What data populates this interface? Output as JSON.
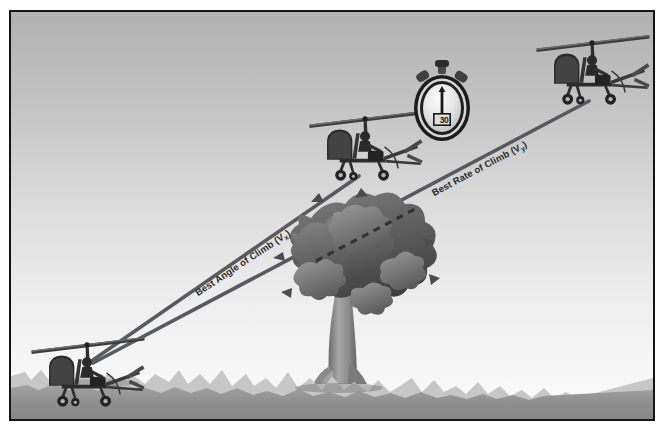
{
  "figure": {
    "border_color": "#141414",
    "background_color": "#ffffff"
  },
  "sky": {
    "name": "sky-gradient",
    "top_color": "#b4b4b4",
    "bottom_color": "#fbfbfb"
  },
  "ground": {
    "name": "ground",
    "grass_tip_color": "#c9c9c9",
    "mid_color": "#9c9c9c",
    "fore_color": "#8b8b8b",
    "horizon_y": 372
  },
  "labels": {
    "vx": {
      "text": "Best Angle of Climb (V",
      "subscript": "x",
      "suffix": ")",
      "full": "Best Angle of Climb (Vx)",
      "color": "#2b2b2b",
      "rotation_deg": -33.5
    },
    "vy": {
      "text": "Best Rate of Climb (V",
      "subscript": "y",
      "suffix": ")",
      "full": "Best Rate of Climb (Vy)",
      "color": "#2b2b2b",
      "rotation_deg": -28
    }
  },
  "flight_paths": {
    "vx_path": {
      "name": "best-angle-of-climb-path",
      "start": [
        92,
        357
      ],
      "end": [
        357,
        173
      ],
      "color": "#56585c",
      "width": 3.4,
      "style": "solid"
    },
    "vy_path": {
      "name": "best-rate-of-climb-path",
      "start": [
        92,
        360
      ],
      "end": [
        587,
        98
      ],
      "color": "#56585c",
      "width": 3.4,
      "style": "solid-with-dashed-occlusion"
    },
    "vy_dashed_segment": {
      "name": "best-rate-of-climb-dashed-behind-tree",
      "start": [
        320,
        249
      ],
      "end": [
        412,
        201
      ],
      "color": "#3a3a3a",
      "dash": "6 5"
    }
  },
  "aircraft": [
    {
      "name": "gyroplane-start",
      "label": "Gyroplane at takeoff",
      "x": 28,
      "y": 332,
      "scale": 1.0
    },
    {
      "name": "gyroplane-vx-top",
      "label": "Gyroplane at best angle of climb altitude",
      "x": 306,
      "y": 106,
      "scale": 1.0
    },
    {
      "name": "gyroplane-vy-top",
      "label": "Gyroplane at best rate of climb altitude",
      "x": 533,
      "y": 30,
      "scale": 1.0
    }
  ],
  "stopwatch": {
    "name": "stopwatch",
    "display_value": "30",
    "case_color": "#1d1d1d",
    "face_color": "#e9e9e9",
    "needle_color": "#1a1a1a",
    "crown_color": "#5a5a5a"
  },
  "tree": {
    "name": "obstacle-tree",
    "label": "Obstacle tree",
    "canopy_dark": "#4d4d4d",
    "canopy_mid": "#6e6e6e",
    "canopy_light": "#8f8f8f",
    "trunk_color": "#9a9a9a",
    "trunk_shadow": "#6f6f6f",
    "x": 300,
    "y": 186,
    "width": 190,
    "height": 200
  }
}
